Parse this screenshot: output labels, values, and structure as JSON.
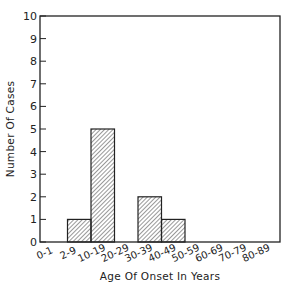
{
  "chart_data": {
    "type": "bar",
    "title": "",
    "xlabel": "Age Of Onset In Years",
    "ylabel": "Number Of Cases",
    "categories": [
      "0-1",
      "2-9",
      "10-19",
      "20-29",
      "30-39",
      "40-49",
      "50-59",
      "60-69",
      "70-79",
      "80-89"
    ],
    "values": [
      0,
      1,
      5,
      0,
      2,
      1,
      0,
      0,
      0,
      0
    ],
    "ylim": [
      0,
      10
    ],
    "yticks": [
      0,
      1,
      2,
      3,
      4,
      5,
      6,
      7,
      8,
      9,
      10
    ],
    "grid": false,
    "legend": null,
    "bar_fill": "diagonal-hatch"
  },
  "labels": {
    "xlabel": "Age Of Onset In Years",
    "ylabel": "Number Of Cases",
    "yticks": [
      "0",
      "1",
      "2",
      "3",
      "4",
      "5",
      "6",
      "7",
      "8",
      "9",
      "10"
    ],
    "xticks": [
      "0-1",
      "2-9",
      "10-19",
      "20-29",
      "30-39",
      "40-49",
      "50-59",
      "60-69",
      "70-79",
      "80-89"
    ]
  },
  "colors": {
    "ink": "#222222",
    "background": "#ffffff"
  }
}
